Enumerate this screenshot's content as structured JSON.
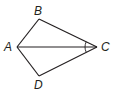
{
  "diagram": {
    "type": "geometry-kite",
    "points": {
      "A": {
        "label": "A",
        "x": 17,
        "y": 47
      },
      "B": {
        "label": "B",
        "x": 39,
        "y": 19
      },
      "C": {
        "label": "C",
        "x": 97,
        "y": 47
      },
      "D": {
        "label": "D",
        "x": 39,
        "y": 76
      }
    },
    "segments": [
      "AB",
      "BC",
      "CD",
      "DA",
      "AC"
    ],
    "angle_marks": [
      {
        "vertex": "C",
        "between": [
          "B",
          "A"
        ],
        "arcs": 1
      },
      {
        "vertex": "C",
        "between": [
          "A",
          "D"
        ],
        "arcs": 1
      }
    ],
    "colors": {
      "stroke": "#231f20",
      "background": "#ffffff"
    }
  }
}
